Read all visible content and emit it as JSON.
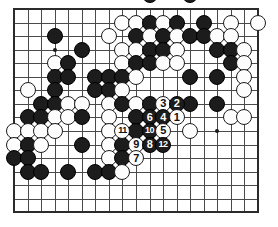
{
  "figure": {
    "kind": "go-board-diagram",
    "title": "",
    "caption": "",
    "board": {
      "columns": 19,
      "rows": 16,
      "left": 14,
      "top": 9,
      "spacing": 13.55,
      "stone_diameter": 16,
      "line_color": "#4a4a4a",
      "border_color": "#2b2b2b",
      "background_color": "#ffffff",
      "black_color": "#1c1c1c",
      "white_color": "#fdfdfd"
    },
    "hoshi_points": [
      {
        "col": 3,
        "row": 3
      },
      {
        "col": 15,
        "row": 9
      }
    ],
    "stones": [
      {
        "col": 10,
        "row": -1,
        "color": "black",
        "label": ""
      },
      {
        "col": 13,
        "row": -1,
        "color": "black",
        "label": ""
      },
      {
        "col": 8,
        "row": 1,
        "color": "white",
        "label": ""
      },
      {
        "col": 9,
        "row": 1,
        "color": "white",
        "label": ""
      },
      {
        "col": 10,
        "row": 1,
        "color": "black",
        "label": ""
      },
      {
        "col": 11,
        "row": 1,
        "color": "white",
        "label": ""
      },
      {
        "col": 12,
        "row": 1,
        "color": "black",
        "label": ""
      },
      {
        "col": 14,
        "row": 1,
        "color": "black",
        "label": ""
      },
      {
        "col": 16,
        "row": 1,
        "color": "white",
        "label": ""
      },
      {
        "col": 18,
        "row": 1,
        "color": "white",
        "label": ""
      },
      {
        "col": 3,
        "row": 2,
        "color": "black",
        "label": ""
      },
      {
        "col": 7,
        "row": 2,
        "color": "white",
        "label": ""
      },
      {
        "col": 9,
        "row": 2,
        "color": "black",
        "label": ""
      },
      {
        "col": 10,
        "row": 2,
        "color": "white",
        "label": ""
      },
      {
        "col": 11,
        "row": 2,
        "color": "black",
        "label": ""
      },
      {
        "col": 12,
        "row": 2,
        "color": "white",
        "label": ""
      },
      {
        "col": 13,
        "row": 2,
        "color": "black",
        "label": ""
      },
      {
        "col": 14,
        "row": 2,
        "color": "black",
        "label": ""
      },
      {
        "col": 15,
        "row": 2,
        "color": "white",
        "label": ""
      },
      {
        "col": 16,
        "row": 2,
        "color": "white",
        "label": ""
      },
      {
        "col": 5,
        "row": 3,
        "color": "black",
        "label": ""
      },
      {
        "col": 8,
        "row": 3,
        "color": "white",
        "label": ""
      },
      {
        "col": 9,
        "row": 3,
        "color": "white",
        "label": ""
      },
      {
        "col": 10,
        "row": 3,
        "color": "black",
        "label": ""
      },
      {
        "col": 11,
        "row": 3,
        "color": "black",
        "label": ""
      },
      {
        "col": 12,
        "row": 3,
        "color": "white",
        "label": ""
      },
      {
        "col": 15,
        "row": 3,
        "color": "black",
        "label": ""
      },
      {
        "col": 16,
        "row": 3,
        "color": "black",
        "label": ""
      },
      {
        "col": 17,
        "row": 3,
        "color": "white",
        "label": ""
      },
      {
        "col": 3,
        "row": 4,
        "color": "white",
        "label": ""
      },
      {
        "col": 4,
        "row": 4,
        "color": "black",
        "label": ""
      },
      {
        "col": 8,
        "row": 4,
        "color": "white",
        "label": ""
      },
      {
        "col": 9,
        "row": 4,
        "color": "black",
        "label": ""
      },
      {
        "col": 10,
        "row": 4,
        "color": "black",
        "label": ""
      },
      {
        "col": 11,
        "row": 4,
        "color": "white",
        "label": ""
      },
      {
        "col": 12,
        "row": 4,
        "color": "white",
        "label": ""
      },
      {
        "col": 16,
        "row": 4,
        "color": "black",
        "label": ""
      },
      {
        "col": 17,
        "row": 4,
        "color": "white",
        "label": ""
      },
      {
        "col": 3,
        "row": 5,
        "color": "black",
        "label": ""
      },
      {
        "col": 4,
        "row": 5,
        "color": "black",
        "label": ""
      },
      {
        "col": 6,
        "row": 5,
        "color": "black",
        "label": ""
      },
      {
        "col": 7,
        "row": 5,
        "color": "black",
        "label": ""
      },
      {
        "col": 8,
        "row": 5,
        "color": "black",
        "label": ""
      },
      {
        "col": 9,
        "row": 5,
        "color": "white",
        "label": ""
      },
      {
        "col": 13,
        "row": 5,
        "color": "black",
        "label": ""
      },
      {
        "col": 15,
        "row": 5,
        "color": "black",
        "label": ""
      },
      {
        "col": 17,
        "row": 5,
        "color": "white",
        "label": ""
      },
      {
        "col": 1,
        "row": 6,
        "color": "white",
        "label": ""
      },
      {
        "col": 3,
        "row": 6,
        "color": "black",
        "label": ""
      },
      {
        "col": 6,
        "row": 6,
        "color": "black",
        "label": ""
      },
      {
        "col": 7,
        "row": 6,
        "color": "black",
        "label": ""
      },
      {
        "col": 8,
        "row": 6,
        "color": "white",
        "label": ""
      },
      {
        "col": 17,
        "row": 6,
        "color": "white",
        "label": ""
      },
      {
        "col": 2,
        "row": 7,
        "color": "black",
        "label": ""
      },
      {
        "col": 3,
        "row": 7,
        "color": "black",
        "label": ""
      },
      {
        "col": 4,
        "row": 7,
        "color": "white",
        "label": ""
      },
      {
        "col": 5,
        "row": 7,
        "color": "white",
        "label": ""
      },
      {
        "col": 7,
        "row": 7,
        "color": "white",
        "label": ""
      },
      {
        "col": 8,
        "row": 7,
        "color": "black",
        "label": ""
      },
      {
        "col": 9,
        "row": 7,
        "color": "white",
        "label": ""
      },
      {
        "col": 10,
        "row": 7,
        "color": "black",
        "label": ""
      },
      {
        "col": 11,
        "row": 7,
        "color": "white",
        "label": "3"
      },
      {
        "col": 12,
        "row": 7,
        "color": "black",
        "label": "2"
      },
      {
        "col": 13,
        "row": 7,
        "color": "black",
        "label": ""
      },
      {
        "col": 15,
        "row": 7,
        "color": "black",
        "label": ""
      },
      {
        "col": 1,
        "row": 8,
        "color": "black",
        "label": ""
      },
      {
        "col": 2,
        "row": 8,
        "color": "black",
        "label": ""
      },
      {
        "col": 3,
        "row": 8,
        "color": "white",
        "label": ""
      },
      {
        "col": 4,
        "row": 8,
        "color": "white",
        "label": ""
      },
      {
        "col": 5,
        "row": 8,
        "color": "black",
        "label": ""
      },
      {
        "col": 7,
        "row": 8,
        "color": "white",
        "label": ""
      },
      {
        "col": 9,
        "row": 8,
        "color": "black",
        "label": ""
      },
      {
        "col": 10,
        "row": 8,
        "color": "black",
        "label": "6"
      },
      {
        "col": 11,
        "row": 8,
        "color": "black",
        "label": "4"
      },
      {
        "col": 12,
        "row": 8,
        "color": "white",
        "label": "1"
      },
      {
        "col": 16,
        "row": 8,
        "color": "white",
        "label": ""
      },
      {
        "col": 17,
        "row": 8,
        "color": "white",
        "label": ""
      },
      {
        "col": 0,
        "row": 9,
        "color": "white",
        "label": ""
      },
      {
        "col": 1,
        "row": 9,
        "color": "white",
        "label": ""
      },
      {
        "col": 2,
        "row": 9,
        "color": "white",
        "label": ""
      },
      {
        "col": 3,
        "row": 9,
        "color": "white",
        "label": ""
      },
      {
        "col": 7,
        "row": 9,
        "color": "white",
        "label": ""
      },
      {
        "col": 8,
        "row": 9,
        "color": "white",
        "label": "11"
      },
      {
        "col": 9,
        "row": 9,
        "color": "black",
        "label": ""
      },
      {
        "col": 10,
        "row": 9,
        "color": "black",
        "label": "10"
      },
      {
        "col": 11,
        "row": 9,
        "color": "white",
        "label": "5"
      },
      {
        "col": 13,
        "row": 9,
        "color": "white",
        "label": ""
      },
      {
        "col": 0,
        "row": 10,
        "color": "white",
        "label": ""
      },
      {
        "col": 1,
        "row": 10,
        "color": "black",
        "label": ""
      },
      {
        "col": 2,
        "row": 10,
        "color": "white",
        "label": ""
      },
      {
        "col": 5,
        "row": 10,
        "color": "black",
        "label": ""
      },
      {
        "col": 7,
        "row": 10,
        "color": "white",
        "label": ""
      },
      {
        "col": 8,
        "row": 10,
        "color": "black",
        "label": ""
      },
      {
        "col": 9,
        "row": 10,
        "color": "white",
        "label": "9"
      },
      {
        "col": 10,
        "row": 10,
        "color": "black",
        "label": "8"
      },
      {
        "col": 11,
        "row": 10,
        "color": "black",
        "label": "12"
      },
      {
        "col": 0,
        "row": 11,
        "color": "black",
        "label": ""
      },
      {
        "col": 1,
        "row": 11,
        "color": "black",
        "label": ""
      },
      {
        "col": 7,
        "row": 11,
        "color": "white",
        "label": ""
      },
      {
        "col": 8,
        "row": 11,
        "color": "black",
        "label": ""
      },
      {
        "col": 9,
        "row": 11,
        "color": "white",
        "label": "7"
      },
      {
        "col": 1,
        "row": 12,
        "color": "black",
        "label": ""
      },
      {
        "col": 2,
        "row": 12,
        "color": "black",
        "label": ""
      },
      {
        "col": 4,
        "row": 12,
        "color": "black",
        "label": ""
      },
      {
        "col": 6,
        "row": 12,
        "color": "black",
        "label": ""
      },
      {
        "col": 7,
        "row": 12,
        "color": "black",
        "label": ""
      },
      {
        "col": 8,
        "row": 12,
        "color": "white",
        "label": ""
      }
    ],
    "move_numbers": [
      {
        "number": "1",
        "color": "white"
      },
      {
        "number": "2",
        "color": "black"
      },
      {
        "number": "3",
        "color": "white"
      },
      {
        "number": "4",
        "color": "black"
      },
      {
        "number": "5",
        "color": "white"
      },
      {
        "number": "6",
        "color": "black"
      },
      {
        "number": "7",
        "color": "white"
      },
      {
        "number": "8",
        "color": "black"
      },
      {
        "number": "9",
        "color": "white"
      },
      {
        "number": "10",
        "color": "black"
      },
      {
        "number": "11",
        "color": "white"
      },
      {
        "number": "12",
        "color": "black"
      }
    ]
  }
}
